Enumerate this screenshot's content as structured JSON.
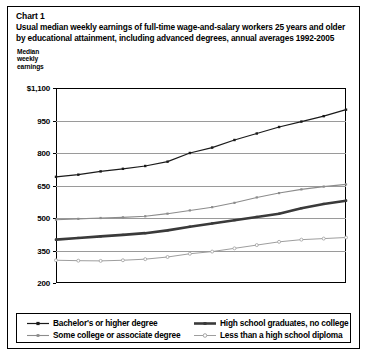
{
  "chart_label": "Chart 1",
  "title_lines": [
    "Usual median weekly earnings of full-time wage-and-salary workers 25 years and older",
    "by educational attainment, including advanced degrees, annual averages 1992-2005"
  ],
  "y_axis_caption": "Median weekly earnings",
  "x_axis_title": "Year",
  "colors": {
    "bachelors": "#1a1a1a",
    "some_college": "#8c8c8c",
    "hs_grad": "#3a3a3a",
    "less_hs": "#9e9e9e",
    "gridline": "#9a9a9a",
    "frame": "#000000",
    "background": "#ffffff"
  },
  "legend": [
    {
      "label": "Bachelor's or higher degree",
      "marker": "filled-square",
      "color": "#1a1a1a",
      "width": 1.2
    },
    {
      "label": "Some college or associate degree",
      "marker": "small-square",
      "color": "#8c8c8c",
      "width": 1.1
    },
    {
      "label": "High school graduates, no college",
      "marker": "thick-line",
      "color": "#3a3a3a",
      "width": 2.6
    },
    {
      "label": "Less than a high school diploma",
      "marker": "open-circle",
      "color": "#9e9e9e",
      "width": 1.0
    }
  ],
  "chart_data": {
    "type": "line",
    "title": "Usual median weekly earnings of full-time wage-and-salary workers 25 years and older by educational attainment, including advanced degrees, annual averages 1992-2005",
    "xlabel": "Year",
    "ylabel": "Median weekly earnings",
    "x": [
      1992,
      1993,
      1994,
      1995,
      1996,
      1997,
      1998,
      1999,
      2000,
      2001,
      2002,
      2003,
      2004,
      2005
    ],
    "xtick_labels": [
      "1993",
      "1995",
      "1997",
      "1999",
      "2001",
      "2003",
      "2005"
    ],
    "xtick_values": [
      1993,
      1995,
      1997,
      1999,
      2001,
      2003,
      2005
    ],
    "xlim": [
      1992,
      2005
    ],
    "ytick_labels": [
      "$1,100",
      "950",
      "800",
      "650",
      "500",
      "350",
      "200"
    ],
    "ytick_values": [
      1100,
      950,
      800,
      650,
      500,
      350,
      200
    ],
    "ylim": [
      200,
      1100
    ],
    "grid": true,
    "legend_position": "bottom",
    "series": [
      {
        "name": "Bachelor's or higher degree",
        "color": "#1a1a1a",
        "marker": "filled-square",
        "values": [
          690,
          700,
          715,
          727,
          740,
          760,
          800,
          825,
          860,
          890,
          920,
          945,
          970,
          1000
        ]
      },
      {
        "name": "Some college or associate degree",
        "color": "#8c8c8c",
        "marker": "small-square",
        "values": [
          492,
          496,
          500,
          503,
          508,
          520,
          535,
          550,
          570,
          595,
          615,
          632,
          645,
          655
        ]
      },
      {
        "name": "High school graduates, no college",
        "color": "#3a3a3a",
        "marker": "thick-line",
        "values": [
          400,
          408,
          415,
          422,
          430,
          443,
          460,
          475,
          490,
          505,
          520,
          545,
          565,
          580
        ]
      },
      {
        "name": "Less than a high school diploma",
        "color": "#9e9e9e",
        "marker": "open-circle",
        "values": [
          305,
          303,
          302,
          305,
          310,
          320,
          335,
          345,
          360,
          375,
          390,
          400,
          405,
          410
        ]
      }
    ]
  }
}
